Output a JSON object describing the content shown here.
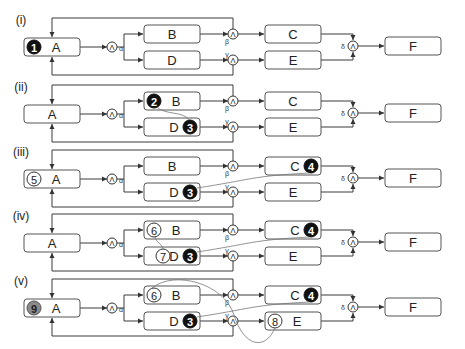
{
  "diagram": {
    "type": "flow-diagram",
    "nodes": [
      "A",
      "B",
      "C",
      "D",
      "E",
      "F"
    ],
    "gates": {
      "alpha": {
        "symbol": "Λ",
        "label": "α"
      },
      "beta": {
        "symbol": "Λ",
        "label": "β"
      },
      "gamma": {
        "symbol": "Λ",
        "label": "γ"
      },
      "delta": {
        "symbol": "Λ",
        "label": "δ"
      }
    },
    "panels": [
      {
        "label": "(i)",
        "markers": [
          {
            "node": "A",
            "number": "1",
            "style": "filled-black",
            "position": "left"
          }
        ],
        "links": []
      },
      {
        "label": "(ii)",
        "markers": [
          {
            "node": "B",
            "number": "2",
            "style": "filled-black",
            "position": "left"
          },
          {
            "node": "D",
            "number": "3",
            "style": "filled-black",
            "position": "right"
          }
        ],
        "links": [
          {
            "from": "2",
            "to": "3"
          }
        ]
      },
      {
        "label": "(iii)",
        "markers": [
          {
            "node": "A",
            "number": "5",
            "style": "outline",
            "position": "left"
          },
          {
            "node": "D",
            "number": "3",
            "style": "filled-black",
            "position": "right"
          },
          {
            "node": "C",
            "number": "4",
            "style": "filled-black",
            "position": "right"
          }
        ],
        "links": [
          {
            "from": "3",
            "to": "4"
          }
        ]
      },
      {
        "label": "(iv)",
        "markers": [
          {
            "node": "B",
            "number": "6",
            "style": "outline",
            "position": "left"
          },
          {
            "node": "D",
            "number": "7",
            "style": "outline",
            "position": "left"
          },
          {
            "node": "D",
            "number": "3",
            "style": "filled-black",
            "position": "right"
          },
          {
            "node": "C",
            "number": "4",
            "style": "filled-black",
            "position": "right"
          }
        ],
        "links": [
          {
            "from": "6",
            "to": "7"
          },
          {
            "from": "3",
            "to": "4"
          }
        ]
      },
      {
        "label": "(v)",
        "markers": [
          {
            "node": "A",
            "number": "9",
            "style": "filled-gray",
            "position": "left"
          },
          {
            "node": "B",
            "number": "6",
            "style": "outline",
            "position": "left"
          },
          {
            "node": "D",
            "number": "3",
            "style": "filled-black",
            "position": "right"
          },
          {
            "node": "C",
            "number": "4",
            "style": "filled-black",
            "position": "right"
          },
          {
            "node": "E",
            "number": "8",
            "style": "outline",
            "position": "left"
          }
        ],
        "links": [
          {
            "from": "6",
            "to": "8"
          },
          {
            "from": "3",
            "to": "4"
          }
        ]
      }
    ],
    "colors": {
      "line": "#3a3a3a",
      "box_border": "#555555",
      "marker_black": "#111111",
      "marker_gray": "#8a8a8a",
      "link_curve": "#777777"
    }
  }
}
